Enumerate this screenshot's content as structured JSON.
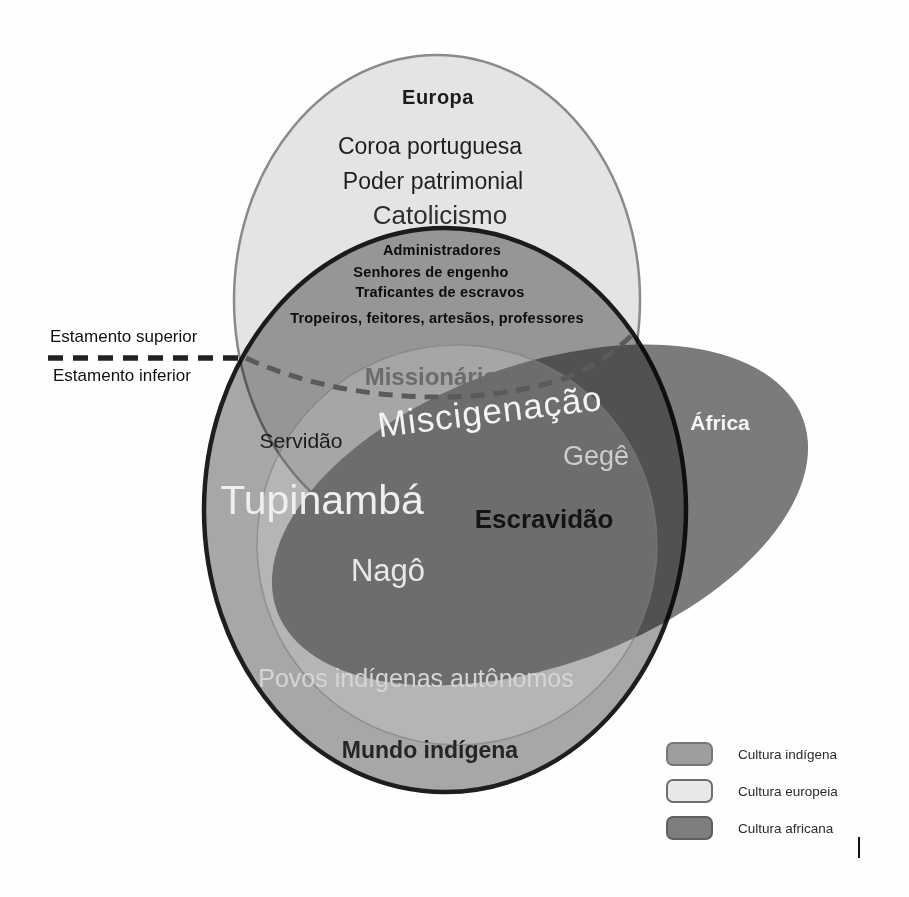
{
  "colors": {
    "europe_fill": "#e4e4e4",
    "europe_stroke": "#8a8a8a",
    "indigenous_fill": "#a8a8a8",
    "indigenous_stroke": "#1e1e1e",
    "africa_fill": "#7b7b7b",
    "mix_circle_fill": "rgba(255,255,255,0.16)",
    "mix_circle_stroke": "rgba(125,125,125,0.6)",
    "divider_solid": "#222222",
    "divider_curve": "#5a5a5a"
  },
  "diagram": {
    "europe_title": "Europa",
    "coroa": "Coroa portuguesa",
    "poder": "Poder patrimonial",
    "catolicismo": "Catolicismo",
    "estratos": [
      "Administradores",
      "Senhores de engenho",
      "Traficantes de escravos",
      "Tropeiros, feitores, artesãos, professores"
    ],
    "divider": {
      "above": "Estamento superior",
      "below": "Estamento inferior"
    },
    "missionarios": "Missionários",
    "miscigenacao": "Miscigenação",
    "servidao": "Servidão",
    "gege": "Gegê",
    "africa_title": "África",
    "tupinamba": "Tupinambá",
    "escravidao": "Escravidão",
    "nago": "Nagô",
    "povos": "Povos indígenas autônomos",
    "mundo_indigena": "Mundo indígena"
  },
  "legend": {
    "items": [
      {
        "label": "Cultura indígena",
        "fill": "#9e9e9e",
        "border": "#787878"
      },
      {
        "label": "Cultura europeia",
        "fill": "#e8e8e8",
        "border": "#6f6f6f"
      },
      {
        "label": "Cultura africana",
        "fill": "#7e7e7e",
        "border": "#5f5f5f"
      }
    ]
  }
}
